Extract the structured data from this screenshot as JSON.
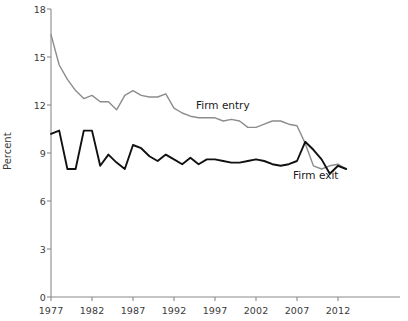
{
  "chart_data": {
    "type": "line",
    "title": "",
    "xlabel": "",
    "ylabel": "Percent",
    "xlim": [
      1977,
      2013
    ],
    "ylim": [
      0,
      18
    ],
    "ytick_values": [
      0,
      3,
      6,
      9,
      12,
      15,
      18
    ],
    "ytick_labels": [
      "0",
      "3",
      "6",
      "9",
      "12",
      "15",
      "18"
    ],
    "xtick_values": [
      1977,
      1982,
      1987,
      1992,
      1997,
      2002,
      2007,
      2012
    ],
    "xtick_labels": [
      "1977",
      "1982",
      "1987",
      "1992",
      "1997",
      "2002",
      "2007",
      "2012"
    ],
    "grid": false,
    "legend_position": "inline-annotations",
    "x": [
      1977,
      1978,
      1979,
      1980,
      1981,
      1982,
      1983,
      1984,
      1985,
      1986,
      1987,
      1988,
      1989,
      1990,
      1991,
      1992,
      1993,
      1994,
      1995,
      1996,
      1997,
      1998,
      1999,
      2000,
      2001,
      2002,
      2003,
      2004,
      2005,
      2006,
      2007,
      2008,
      2009,
      2010,
      2011,
      2012,
      2013
    ],
    "series": [
      {
        "name": "Firm entry",
        "color": "#8c8c8c",
        "values": [
          16.4,
          14.5,
          13.6,
          12.9,
          12.4,
          12.6,
          12.2,
          12.2,
          11.7,
          12.6,
          12.9,
          12.6,
          12.5,
          12.5,
          12.7,
          11.8,
          11.5,
          11.3,
          11.2,
          11.2,
          11.2,
          11.0,
          11.1,
          11.0,
          10.6,
          10.6,
          10.8,
          11.0,
          11.0,
          10.8,
          10.7,
          9.6,
          8.2,
          8.0,
          8.2,
          8.3,
          8.0
        ]
      },
      {
        "name": "Firm exit",
        "color": "#111111",
        "values": [
          10.2,
          10.4,
          8.0,
          8.0,
          10.4,
          10.4,
          8.2,
          8.9,
          8.4,
          8.0,
          9.5,
          9.3,
          8.8,
          8.5,
          8.9,
          8.6,
          8.3,
          8.7,
          8.3,
          8.6,
          8.6,
          8.5,
          8.4,
          8.4,
          8.5,
          8.6,
          8.5,
          8.3,
          8.2,
          8.3,
          8.5,
          9.7,
          9.2,
          8.6,
          7.7,
          8.2,
          8.0
        ]
      }
    ],
    "annotations": [
      {
        "text": "Firm entry",
        "series": "Firm entry"
      },
      {
        "text": "Firm exit",
        "series": "Firm exit"
      }
    ]
  },
  "axes": {
    "y_axis_title": "Percent"
  },
  "colors": {
    "firm_entry_line": "#8c8c8c",
    "firm_exit_line": "#111111",
    "axis": "#8a8a8a",
    "text": "#3a3a3a"
  }
}
